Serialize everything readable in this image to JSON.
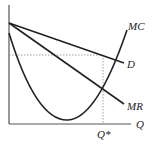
{
  "diagram": {
    "type": "economics-monopoly",
    "labels": {
      "mc": "MC",
      "d": "D",
      "mr": "MR",
      "q_axis": "Q",
      "q_star": "Q*"
    },
    "colors": {
      "line": "#222222",
      "dotted": "#888888",
      "background": "#ffffff"
    }
  }
}
